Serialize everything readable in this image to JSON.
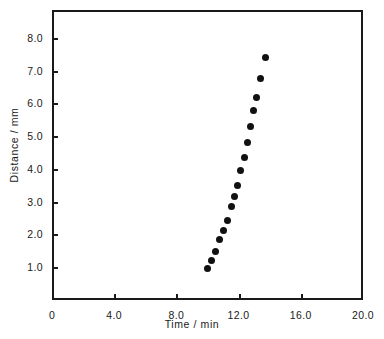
{
  "chart_data": {
    "type": "scatter",
    "title": "",
    "xlabel": "Time / min",
    "ylabel": "Distance / mm",
    "xlim": [
      0,
      20.0
    ],
    "ylim": [
      0,
      8.85
    ],
    "grid": false,
    "legend": null,
    "xticks": [
      {
        "value": 0,
        "label": "0"
      },
      {
        "value": 4.0,
        "label": "4.0"
      },
      {
        "value": 8.0,
        "label": "8.0"
      },
      {
        "value": 12.0,
        "label": "12.0"
      },
      {
        "value": 16.0,
        "label": "16.0"
      },
      {
        "value": 20.0,
        "label": "20.0"
      }
    ],
    "yticks": [
      {
        "value": 1.0,
        "label": "1.0"
      },
      {
        "value": 2.0,
        "label": "2.0"
      },
      {
        "value": 3.0,
        "label": "3.0"
      },
      {
        "value": 4.0,
        "label": "4.0"
      },
      {
        "value": 5.0,
        "label": "5.0"
      },
      {
        "value": 6.0,
        "label": "6.0"
      },
      {
        "value": 7.0,
        "label": "7.0"
      },
      {
        "value": 8.0,
        "label": "8.0"
      }
    ],
    "marker": {
      "shape": "circle",
      "filled": true,
      "color": "#111111",
      "size_px": 7
    },
    "series": [
      {
        "name": "",
        "x": [
          10.0,
          10.25,
          10.5,
          10.8,
          11.0,
          11.3,
          11.55,
          11.75,
          11.95,
          12.15,
          12.35,
          12.55,
          12.75,
          12.95,
          13.15,
          13.4,
          13.65,
          14.0
        ],
        "y": [
          0.95,
          1.22,
          1.49,
          1.86,
          2.11,
          2.44,
          2.85,
          3.17,
          3.5,
          3.94,
          4.36,
          4.8,
          5.28,
          5.78,
          6.18,
          6.75,
          7.4,
          7.4
        ]
      }
    ],
    "points": [
      {
        "x": 10.0,
        "y": 0.95
      },
      {
        "x": 10.25,
        "y": 1.22
      },
      {
        "x": 10.5,
        "y": 1.49
      },
      {
        "x": 10.8,
        "y": 1.86
      },
      {
        "x": 11.0,
        "y": 2.11
      },
      {
        "x": 11.3,
        "y": 2.44
      },
      {
        "x": 11.55,
        "y": 2.85
      },
      {
        "x": 11.75,
        "y": 3.17
      },
      {
        "x": 11.95,
        "y": 3.5
      },
      {
        "x": 12.15,
        "y": 3.94
      },
      {
        "x": 12.35,
        "y": 4.36
      },
      {
        "x": 12.55,
        "y": 4.8
      },
      {
        "x": 12.75,
        "y": 5.28
      },
      {
        "x": 12.95,
        "y": 5.78
      },
      {
        "x": 13.15,
        "y": 6.18
      },
      {
        "x": 13.4,
        "y": 6.75
      },
      {
        "x": 13.7,
        "y": 7.4
      }
    ]
  },
  "colors": {
    "axis": "#1a1a1a",
    "marker": "#111111",
    "background": "#ffffff"
  }
}
